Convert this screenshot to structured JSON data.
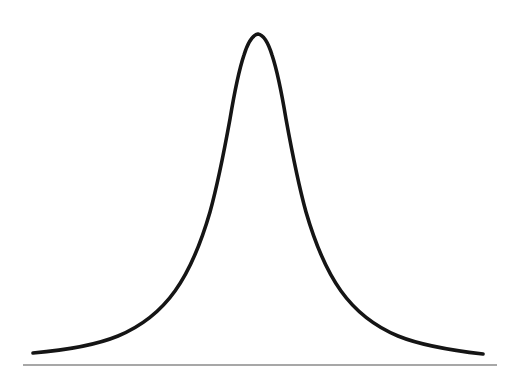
{
  "figure": {
    "title": "",
    "width": 523,
    "height": 387,
    "background_color": "#ffffff",
    "curve_color": "#151515",
    "curve_stroke_width": 3.6,
    "baseline_color": "#8a8a8a",
    "baseline_stroke_width": 1.6,
    "baseline_y": 365,
    "baseline_x_start": 23,
    "baseline_x_end": 497,
    "curve_path": "M 33 353 C 68 350 96 345 118 336 C 142 326 160 312 175 291 C 190 270 201 243 210 212 C 218 183 224 152 230 119 C 234 95 238 73 244 55 C 248 42 252 35 258 34 C 264 35 268 42 272 55 C 278 73 282 95 286 119 C 292 152 298 183 306 212 C 315 243 326 270 341 291 C 356 312 374 326 398 336 C 420 345 448 350 483 354"
  },
  "chart_data": {
    "type": "line",
    "title": "",
    "subtitle": "",
    "xlabel": "",
    "ylabel": "",
    "grid": false,
    "legend": null,
    "axes_shown": [
      "x"
    ],
    "tick_labels": {
      "x": [],
      "y": []
    },
    "xlim": [
      -3.5,
      3.5
    ],
    "ylim": [
      0,
      1
    ],
    "peak": {
      "x_px": 258,
      "y_px": 34,
      "x": 0,
      "y": 1
    },
    "series": [
      {
        "name": "bell-curve",
        "x": [
          -3.5,
          -3.2,
          -2.9,
          -2.6,
          -2.3,
          -2.0,
          -1.7,
          -1.4,
          -1.1,
          -0.8,
          -0.5,
          -0.2,
          0.0,
          0.2,
          0.5,
          0.8,
          1.1,
          1.4,
          1.7,
          2.0,
          2.3,
          2.6,
          2.9,
          3.2,
          3.5
        ],
        "y": [
          0.01,
          0.02,
          0.03,
          0.05,
          0.08,
          0.13,
          0.21,
          0.33,
          0.48,
          0.67,
          0.85,
          0.97,
          1.0,
          0.97,
          0.85,
          0.67,
          0.48,
          0.33,
          0.21,
          0.13,
          0.08,
          0.05,
          0.03,
          0.02,
          0.01
        ]
      }
    ],
    "pixel_samples": {
      "note": "Curve centerline crossings measured from the screenshot in pixel coordinates.",
      "left_tail_end": [
        33,
        353
      ],
      "right_tail_end": [
        483,
        354
      ],
      "at_y_100": [
        220,
        292
      ],
      "at_y_200": [
        202,
        310
      ],
      "at_y_300": [
        155,
        365
      ]
    }
  }
}
